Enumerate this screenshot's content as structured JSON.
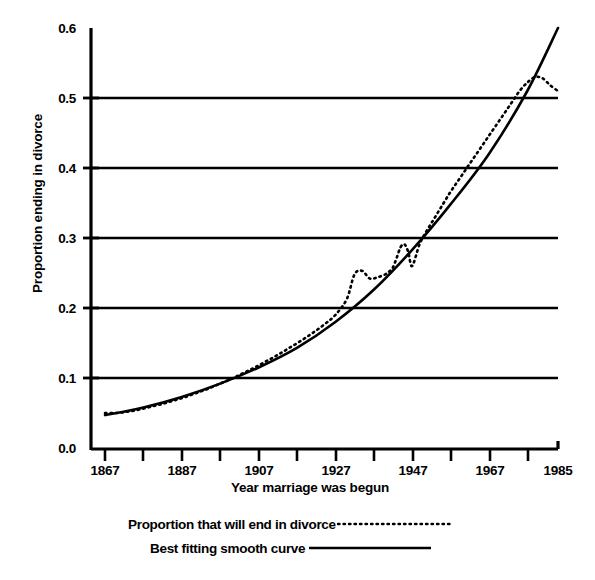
{
  "chart_data": {
    "type": "line",
    "title": "",
    "xlabel": "Year marriage was begun",
    "ylabel": "Proportion ending in divorce",
    "xlim": [
      1867,
      1985
    ],
    "ylim": [
      0.0,
      0.6
    ],
    "grid": "horizontal gridlines at 0.1 through 0.5",
    "legend_position": "below-plot",
    "xticks": [
      1867,
      1887,
      1907,
      1927,
      1947,
      1967,
      1985
    ],
    "xticks_minor": [
      1877,
      1897,
      1917,
      1937,
      1957,
      1977
    ],
    "yticks": [
      "0.0",
      "0.1",
      "0.2",
      "0.3",
      "0.4",
      "0.5",
      "0.6"
    ],
    "series": [
      {
        "name": "Proportion that will end in divorce",
        "style": "dotted",
        "x": [
          1867,
          1870,
          1873,
          1876,
          1879,
          1882,
          1885,
          1888,
          1891,
          1894,
          1897,
          1900,
          1903,
          1906,
          1909,
          1912,
          1915,
          1918,
          1921,
          1924,
          1927,
          1930,
          1932,
          1934,
          1936,
          1938,
          1940,
          1941,
          1942,
          1943,
          1944,
          1945,
          1946,
          1947,
          1949,
          1951,
          1953,
          1955,
          1957,
          1959,
          1961,
          1963,
          1965,
          1967,
          1969,
          1971,
          1973,
          1975,
          1977,
          1979,
          1981,
          1983,
          1985
        ],
        "values": [
          0.05,
          0.05,
          0.052,
          0.055,
          0.059,
          0.063,
          0.068,
          0.073,
          0.079,
          0.085,
          0.092,
          0.099,
          0.107,
          0.115,
          0.124,
          0.133,
          0.143,
          0.153,
          0.164,
          0.176,
          0.19,
          0.213,
          0.248,
          0.253,
          0.242,
          0.244,
          0.248,
          0.252,
          0.258,
          0.272,
          0.287,
          0.291,
          0.28,
          0.26,
          0.292,
          0.312,
          0.33,
          0.348,
          0.366,
          0.382,
          0.398,
          0.414,
          0.43,
          0.446,
          0.462,
          0.478,
          0.494,
          0.51,
          0.522,
          0.53,
          0.528,
          0.518,
          0.51
        ]
      },
      {
        "name": "Best fitting smooth curve",
        "style": "solid",
        "x": [
          1867,
          1877,
          1887,
          1897,
          1907,
          1917,
          1927,
          1937,
          1947,
          1957,
          1967,
          1977,
          1985
        ],
        "values": [
          0.047,
          0.058,
          0.073,
          0.092,
          0.115,
          0.143,
          0.18,
          0.226,
          0.283,
          0.348,
          0.42,
          0.51,
          0.6
        ]
      }
    ],
    "annotations": [
      "Dotted series peaks near 0.53 around 1979 then declines to 0.51 at 1985",
      "Dotted series shows a local bump near 1932 and a dip to 0.26 near 1947"
    ]
  },
  "axis": {
    "y_title": "Proportion ending in divorce",
    "x_title": "Year marriage was begun",
    "y_tick_labels": [
      "0.6",
      "0.5",
      "0.4",
      "0.3",
      "0.2",
      "0.1",
      "0.0"
    ],
    "x_tick_labels": [
      "1867",
      "1887",
      "1907",
      "1927",
      "1947",
      "1967",
      "1985"
    ]
  },
  "legend": {
    "items": [
      {
        "label": "Proportion that will end in divorce",
        "style": "dotted"
      },
      {
        "label": "Best fitting smooth curve",
        "style": "solid"
      }
    ]
  },
  "colors": {
    "ink": "#000000",
    "background": "#ffffff"
  }
}
